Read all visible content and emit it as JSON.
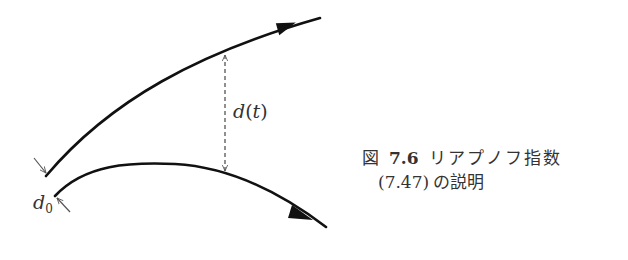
{
  "figure": {
    "caption": {
      "prefix": "図",
      "number": "7.6",
      "title_line1": "リアプノフ指数",
      "equation_ref": "(7.47)",
      "title_line2": "の説明"
    },
    "labels": {
      "separation_t": {
        "symbol": "d",
        "open": "(",
        "arg": "t",
        "close": ")"
      },
      "initial_separation": {
        "symbol": "d",
        "subscript": "0"
      }
    },
    "elements": {
      "upper_trajectory": "diverging trajectory curving upward with arrowhead",
      "lower_trajectory": "neighboring trajectory curving downward with arrowhead",
      "separation_indicator": "dashed double-headed vertical arrow",
      "initial_gap_arrows": "two small inward-pointing arrows marking d0"
    },
    "colors": {
      "stroke": "#111111",
      "annotation": "#555555",
      "text": "#333333"
    }
  }
}
